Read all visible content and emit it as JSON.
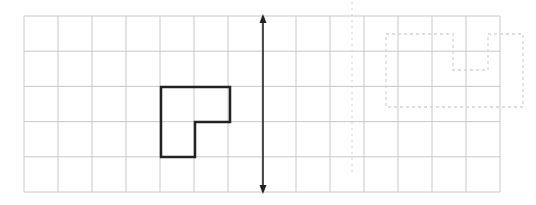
{
  "diagram": {
    "type": "grid-reflection",
    "grid": {
      "columns": 14,
      "rows": 5,
      "origin_x": 24,
      "origin_y": 16,
      "cell_width": 34,
      "cell_height": 35.2,
      "line_color": "#c8c8c8"
    },
    "shape": {
      "name": "L-shape",
      "color": "#222222",
      "points": [
        [
          161,
          87
        ],
        [
          230,
          87
        ],
        [
          230,
          122
        ],
        [
          195,
          122
        ],
        [
          195,
          157
        ],
        [
          161,
          157
        ]
      ]
    },
    "mirror_line": {
      "x": 263,
      "y1": 14,
      "y2": 194,
      "color": "#222222",
      "arrows": "both"
    },
    "faint_dashed_line": {
      "x": 352,
      "y1": 2,
      "y2": 176,
      "color": "#d0d0d0"
    },
    "faint_dashed_shape": {
      "color": "#d4d4d4",
      "points": [
        [
          386,
          34
        ],
        [
          453,
          34
        ],
        [
          453,
          70
        ],
        [
          488,
          70
        ],
        [
          488,
          34
        ],
        [
          523,
          34
        ],
        [
          523,
          107
        ],
        [
          386,
          107
        ]
      ]
    }
  }
}
